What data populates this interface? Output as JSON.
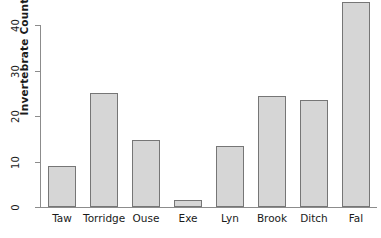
{
  "chart_data": {
    "type": "bar",
    "title": "",
    "xlabel": "",
    "ylabel": "Invertebrate Count",
    "categories": [
      "Taw",
      "Torridge",
      "Ouse",
      "Exe",
      "Lyn",
      "Brook",
      "Ditch",
      "Fal"
    ],
    "values": [
      9,
      25,
      14.8,
      1.5,
      13.5,
      24.5,
      23.5,
      45
    ],
    "ylim": [
      0,
      46
    ],
    "yticks": [
      0,
      10,
      20,
      30,
      40
    ],
    "ytick_labels": [
      "0",
      "10",
      "20",
      "30",
      "40"
    ],
    "grid": false,
    "legend": null,
    "bar_fill_color": "#d6d6d6",
    "bar_border_color": "#767676",
    "axis_color": "#8c8c8c",
    "text_color": "#1a1a1a"
  }
}
